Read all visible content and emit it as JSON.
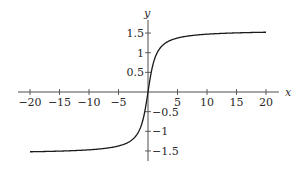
{
  "chart_data": {
    "type": "line",
    "title": "",
    "function": "arctan(x)",
    "xlabel": "x",
    "ylabel": "y",
    "xlim": [
      -20,
      20
    ],
    "ylim": [
      -1.5,
      1.5
    ],
    "grid": false,
    "legend": null,
    "x_ticks": [
      -20,
      -15,
      -10,
      -5,
      5,
      10,
      15,
      20
    ],
    "x_tick_labels": [
      "−20",
      "−15",
      "−10",
      "−5",
      "5",
      "10",
      "15",
      "20"
    ],
    "y_ticks": [
      1.5,
      1,
      0.5,
      -0.5,
      -1,
      -1.5
    ],
    "y_tick_labels": [
      "1.5",
      "1",
      "0.5",
      "−0.5",
      "−1",
      "−1.5"
    ],
    "series": [
      {
        "name": "y = arctan(x)",
        "x": [
          -20,
          -15,
          -10,
          -5,
          -3,
          -2,
          -1,
          -0.5,
          0,
          0.5,
          1,
          2,
          3,
          5,
          10,
          15,
          20
        ],
        "values": [
          -1.52,
          -1.5,
          -1.47,
          -1.37,
          -1.25,
          -1.11,
          -0.79,
          -0.46,
          0,
          0.46,
          0.79,
          1.11,
          1.25,
          1.37,
          1.47,
          1.5,
          1.52
        ]
      }
    ],
    "colors": {
      "curve": "#1a1a1a",
      "axes": "#3a3a3a"
    }
  }
}
